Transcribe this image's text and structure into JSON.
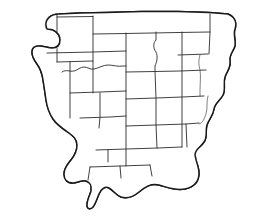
{
  "figure": {
    "kind": "line-art-map",
    "title": "",
    "caption": "",
    "width_px": 258,
    "height_px": 221,
    "background_color": "#ffffff",
    "outline_color": "#1a1a1a",
    "subdivision_color": "#2b2b2b",
    "stipple_color": "#2e2e2e",
    "fill_color": "#ffffff",
    "has_labels": false,
    "has_legend": false,
    "has_scale_bar": false,
    "has_north_arrow": false,
    "has_graticule": false
  },
  "layers": [
    {
      "name": "landmass-outline",
      "label": "coastline and national border outline",
      "style": "solid stroke, white fill"
    },
    {
      "name": "internal-boundaries",
      "label": "internal state and region dividing lines",
      "style": "thin solid strokes forming an irregular grid"
    },
    {
      "name": "coastal-stipple",
      "label": "stippled dot texture along the western, southern and northwestern shores",
      "style": "scattered dot pattern"
    }
  ],
  "regions": {
    "northwest_peninsula": "narrow hooked peninsula at upper left",
    "west_coast_bay": "deep stippled bay along the western margin",
    "south_coast": "stippled southern shoreline",
    "southern_peninsula": "small peninsula projecting south-southwest",
    "southeast_lobe": "rounded lobe along the lower right shoreline",
    "east_coast": "jagged eastern border"
  },
  "interior_cells_approx_count": 24
}
